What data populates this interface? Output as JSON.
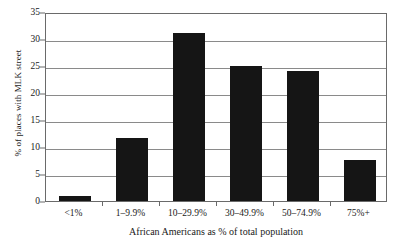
{
  "chart_data": {
    "type": "bar",
    "title": "",
    "xlabel": "African Americans as % of total population",
    "ylabel": "% of places with MLK street",
    "categories": [
      "<1%",
      "1–9.9%",
      "10–29.9%",
      "30–49.9%",
      "50–74.9%",
      "75%+"
    ],
    "values": [
      0.9,
      11.7,
      31.1,
      25.0,
      24.0,
      7.6
    ],
    "ylim": [
      0,
      35
    ],
    "ytick_labels": [
      "0",
      "5",
      "10",
      "15",
      "20",
      "25",
      "30",
      "35"
    ],
    "ytick_values": [
      0,
      5,
      10,
      15,
      20,
      25,
      30,
      35
    ],
    "ytick_step": 5,
    "grid": true,
    "legend": false,
    "bar_color": "#151515",
    "gridline_color": "#8a8a8a",
    "axis_color": "#6a6a6a",
    "background_color": "#ffffff"
  }
}
